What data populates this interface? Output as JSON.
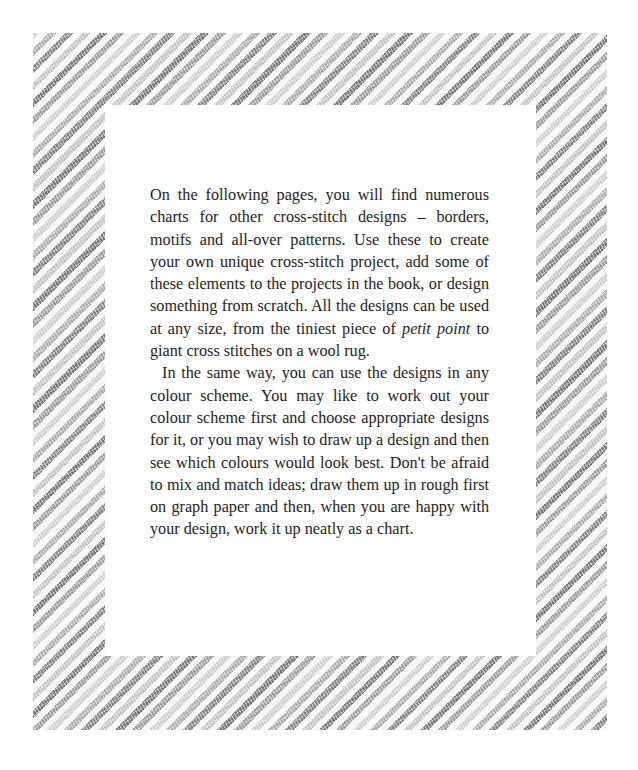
{
  "page": {
    "border": {
      "style": "diagonal cross-stitch stripes",
      "colors": [
        "#7a7a7a",
        "#a4a4a4",
        "#c9c9c9",
        "#ffffff"
      ]
    },
    "body": {
      "paragraph_1": {
        "before_italic": "On the following pages, you will find numerous charts for other cross-stitch designs – borders, motifs and all-over patterns. Use these to create your own unique cross-stitch project, add some of these elements to the projects in the book, or design something from scratch. All the designs can be used at any size, from the tiniest piece of ",
        "italic": "petit point",
        "after_italic": " to giant cross stitches on a wool rug."
      },
      "paragraph_2": "In the same way, you can use the designs in any colour scheme. You may like to work out your colour scheme first and choose appropriate designs for it, or you may wish to draw up a design and then see which colours would look best. Don't be afraid to mix and match ideas; draw them up in rough first on graph paper and then, when you are happy with your design, work it up neatly as a chart."
    }
  }
}
